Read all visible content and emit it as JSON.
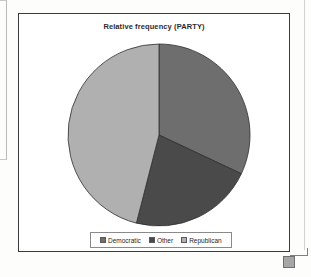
{
  "chart": {
    "title": "Relative frequency (PARTY)",
    "legend": {
      "items": [
        {
          "label": "Democratic",
          "color": "#6e6e6e"
        },
        {
          "label": "Other",
          "color": "#4a4a4a"
        },
        {
          "label": "Republican",
          "color": "#b0b0b0"
        }
      ]
    }
  },
  "chart_data": {
    "type": "pie",
    "title": "Relative frequency (PARTY)",
    "xlabel": "",
    "ylabel": "",
    "categories": [
      "Democratic",
      "Other",
      "Republican"
    ],
    "values": [
      0.32,
      0.22,
      0.46
    ],
    "angles_deg": [
      115,
      80,
      165
    ],
    "colors": [
      "#6e6e6e",
      "#4a4a4a",
      "#b0b0b0"
    ],
    "start_angle_deg": 0,
    "direction": "clockwise",
    "legend_position": "bottom",
    "grid": false,
    "data_labels": false
  }
}
